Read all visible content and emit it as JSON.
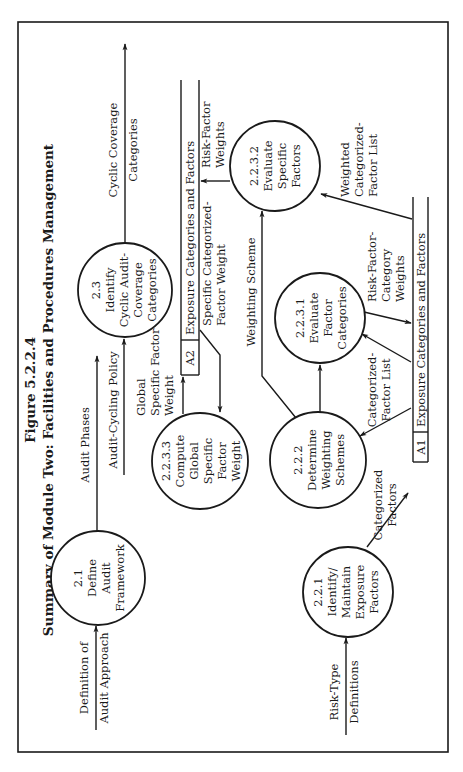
{
  "figure": {
    "number": "Figure 5.2.2.4",
    "title": "Summary of Module Two: Facilities and Procedures Management"
  },
  "processes": [
    {
      "id": "2.1",
      "lines": [
        "2.1",
        "Define",
        "Audit",
        "Framework"
      ]
    },
    {
      "id": "2.3",
      "lines": [
        "2.3",
        "Identify",
        "Cyclic Audit-",
        "Coverage",
        "Categories"
      ]
    },
    {
      "id": "2.2.3.3",
      "lines": [
        "2.2.3.3",
        "Compute",
        "Global",
        "Specific",
        "Factor",
        "Weight"
      ]
    },
    {
      "id": "2.2.3.2",
      "lines": [
        "2.2.3.2",
        "Evaluate",
        "Specific",
        "Factors"
      ]
    },
    {
      "id": "2.2.3.1",
      "lines": [
        "2.2.3.1",
        "Evaluate",
        "Factor",
        "Categories"
      ]
    },
    {
      "id": "2.2.2",
      "lines": [
        "2.2.2",
        "Determine",
        "Weighting",
        "Schemes"
      ]
    },
    {
      "id": "2.2.1",
      "lines": [
        "2.2.1",
        "Identify/",
        "Maintain",
        "Exposure",
        "Factors"
      ]
    }
  ],
  "data_stores": [
    {
      "id": "A1",
      "label": "Exposure Categories and Factors"
    },
    {
      "id": "A2",
      "label": "Exposure Categories and Factors"
    }
  ],
  "external_inputs": [
    {
      "lines": [
        "Definition of",
        "Audit Approach"
      ]
    },
    {
      "lines": [
        "Risk-Type",
        "Definitions"
      ]
    }
  ],
  "flows": {
    "audit_phases": [
      "Audit Phases"
    ],
    "audit_cycling_policy": [
      "Audit-Cycling Policy"
    ],
    "cyclic_coverage": [
      "Cyclic Coverage",
      "Categories"
    ],
    "global_specific_factor_weight": [
      "Global",
      "Specific Factor",
      "Weight"
    ],
    "specific_categorized_factor_weight": [
      "Specific Categorized-",
      "Factor Weight"
    ],
    "risk_factor_weights": [
      "Risk-Factor",
      "Weights"
    ],
    "weighting_scheme": [
      "Weighting Scheme"
    ],
    "weighted_categorized_factor_list": [
      "Weighted",
      "Categorized-",
      "Factor List"
    ],
    "risk_factor_category_weights": [
      "Risk-Factor-",
      "Category",
      "Weights"
    ],
    "categorized_factor_list": [
      "Categorized-",
      "Factor List"
    ],
    "categorized_factors": [
      "Categorized",
      "Factors"
    ]
  }
}
